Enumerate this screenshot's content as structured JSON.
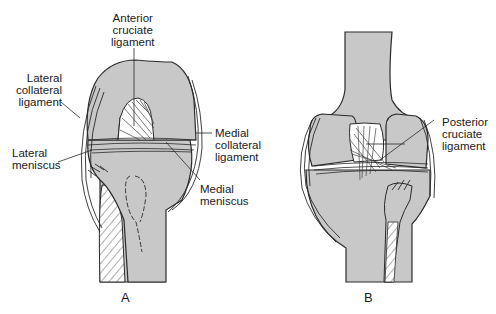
{
  "figure": {
    "colors": {
      "bone": "#c8c8c8",
      "outline": "#2a2a2a",
      "background": "#ffffff"
    }
  },
  "panels": [
    {
      "id": "A",
      "letter": "A",
      "view": "anterior",
      "labels": [
        {
          "key": "acl",
          "text": "Anterior\ncruciate\nligament"
        },
        {
          "key": "lcl",
          "text": "Lateral\ncollateral\nligament"
        },
        {
          "key": "lateral_meniscus",
          "text": "Lateral\nmeniscus"
        },
        {
          "key": "mcl",
          "text": "Medial\ncollateral\nligament"
        },
        {
          "key": "medial_meniscus",
          "text": "Medial\nmeniscus"
        }
      ]
    },
    {
      "id": "B",
      "letter": "B",
      "view": "posterior",
      "labels": [
        {
          "key": "pcl",
          "text": "Posterior\ncruciate\nligament"
        }
      ]
    }
  ]
}
